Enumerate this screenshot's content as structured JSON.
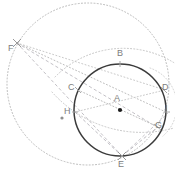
{
  "figure": {
    "type": "geometry-diagram",
    "canvas": {
      "width": 175,
      "height": 183
    },
    "colors": {
      "main_circle": "#3b3b3b",
      "dotted_circle": "#b9b9b9",
      "dashed_line": "#c0bec4",
      "dotted_line": "#bdbdbd",
      "label_text": "#7d7d7d",
      "point_marker": "#9a9a9a",
      "center_marker": "#1a1a1a",
      "background": "#ffffff"
    },
    "main_circle": {
      "label": "main-circle",
      "cx": 120,
      "cy": 110,
      "r": 46,
      "stroke_width": 1.5,
      "style": "solid"
    },
    "outer_circle": {
      "label": "outer-circle",
      "cx": 88,
      "cy": 84,
      "r": 81,
      "stroke_width": 1,
      "style": "dotted"
    },
    "arc_circle": {
      "label": "arc-through-C-D",
      "cx": 120,
      "cy": 19,
      "r": 95,
      "style": "dotted"
    },
    "points": [
      {
        "name": "A",
        "role": "center-of-main-circle",
        "x": 120,
        "y": 110,
        "label_x": 114,
        "label_y": 95,
        "marker": "dot-filled"
      },
      {
        "name": "B",
        "role": "top-of-main-circle",
        "x": 120,
        "y": 64,
        "label_x": 117,
        "label_y": 50,
        "marker": "tick"
      },
      {
        "name": "C",
        "role": "upper-left-on-main-circle",
        "x": 78,
        "y": 90,
        "label_x": 70,
        "label_y": 85,
        "marker": "tick"
      },
      {
        "name": "D",
        "role": "upper-right-on-main-circle",
        "x": 164,
        "y": 90,
        "label_x": 163,
        "label_y": 84,
        "marker": "tick"
      },
      {
        "name": "E",
        "role": "bottom-of-main-circle",
        "x": 122,
        "y": 156,
        "label_x": 119,
        "label_y": 162,
        "marker": "cross"
      },
      {
        "name": "F",
        "role": "external-left-point",
        "x": 17,
        "y": 43,
        "label_x": 9,
        "label_y": 45,
        "marker": "cross"
      },
      {
        "name": "G",
        "role": "lower-right-intersection",
        "x": 155,
        "y": 126,
        "label_x": 155,
        "label_y": 122,
        "marker": "tick"
      },
      {
        "name": "H",
        "role": "left-intersection",
        "x": 75,
        "y": 113,
        "label_x": 66,
        "label_y": 108,
        "marker": "tick"
      },
      {
        "name": "I",
        "role": "right-intersection",
        "x": 167,
        "y": 112,
        "label_x": 165,
        "label_y": 105,
        "marker": "tick"
      },
      {
        "name": "dot-left",
        "role": "outer-circle-center-marker",
        "x": 62,
        "y": 118,
        "label_x": null,
        "label_y": null,
        "marker": "dot-filled"
      }
    ],
    "segments": [
      {
        "name": "F-to-E",
        "style": "dashed",
        "from": "F",
        "to": "E"
      },
      {
        "name": "F-to-G",
        "style": "dashed",
        "from": "F",
        "to": "G"
      },
      {
        "name": "F-to-I",
        "style": "dotted",
        "from": "F",
        "to": "I"
      },
      {
        "name": "F-to-D",
        "style": "dotted",
        "from": "F",
        "to": "D"
      },
      {
        "name": "H-to-E",
        "style": "dashed",
        "from": "H",
        "to": "E"
      },
      {
        "name": "E-to-G",
        "style": "dashed",
        "from": "E",
        "to": "G"
      },
      {
        "name": "E-to-I",
        "style": "dashed",
        "from": "E",
        "to": "I"
      },
      {
        "name": "C-to-A",
        "style": "dotted",
        "from": "C",
        "to": "A"
      },
      {
        "name": "A-to-G",
        "style": "dotted",
        "from": "A",
        "to": "G"
      },
      {
        "name": "H-to-D",
        "style": "dotted",
        "from": "H",
        "to": "D"
      },
      {
        "name": "E-to-C-tick",
        "style": "dotted",
        "from": "E",
        "to": "C"
      }
    ],
    "labels": [
      "A",
      "B",
      "C",
      "D",
      "E",
      "F",
      "G",
      "H",
      "I"
    ]
  }
}
